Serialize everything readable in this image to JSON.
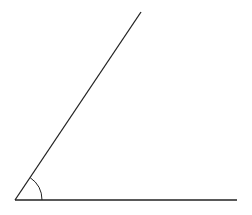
{
  "diagram": {
    "type": "angle",
    "background": "#ffffff",
    "stroke_color": "#222222",
    "vertex": {
      "x": 15,
      "y": 200
    },
    "ray_horizontal": {
      "x1": 15,
      "y1": 200,
      "x2": 237,
      "y2": 200
    },
    "ray_inclined": {
      "x1": 15,
      "y1": 200,
      "x2": 141,
      "y2": 12
    },
    "angle_arc": {
      "cx": 15,
      "cy": 200,
      "r": 27,
      "start_deg": 0,
      "end_deg": 56
    },
    "labels": []
  }
}
